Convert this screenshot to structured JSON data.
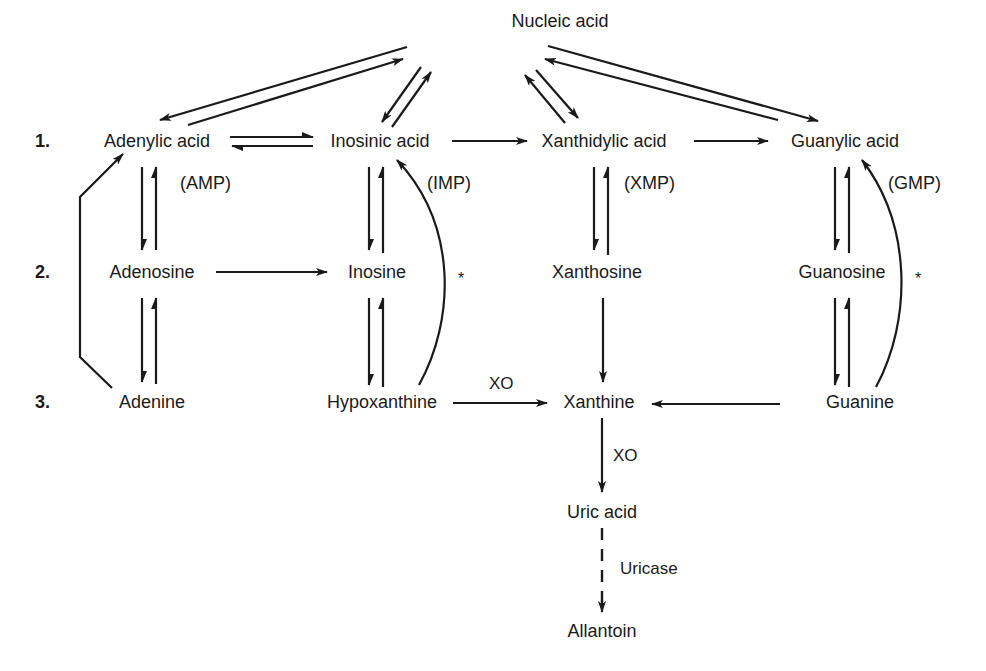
{
  "figure": {
    "type": "purine catabolism pathway diagram",
    "nodes": {
      "nucleic_acid": "Nucleic acid",
      "adenylic_acid": "Adenylic acid",
      "inosinic_acid": "Inosinic acid",
      "xanthidylic_acid": "Xanthidylic acid",
      "guanylic_acid": "Guanylic acid",
      "adenosine": "Adenosine",
      "inosine": "Inosine",
      "xanthosine": "Xanthosine",
      "guanosine": "Guanosine",
      "adenine": "Adenine",
      "hypoxanthine": "Hypoxanthine",
      "xanthine": "Xanthine",
      "guanine": "Guanine",
      "uric_acid": "Uric acid",
      "allantoin": "Allantoin"
    },
    "abbreviations": {
      "amp": "(AMP)",
      "imp": "(IMP)",
      "xmp": "(XMP)",
      "gmp": "(GMP)"
    },
    "row_labels": [
      "1.",
      "2.",
      "3."
    ],
    "enzymes": {
      "xo_hypoxanthine": "XO",
      "xo_xanthine": "XO",
      "uricase": "Uricase"
    },
    "markers": {
      "imp_salvage": "*",
      "gmp_salvage": "*"
    },
    "edges": [
      {
        "from": "Nucleic acid",
        "to": "Adenylic acid",
        "type": "reversible"
      },
      {
        "from": "Nucleic acid",
        "to": "Inosinic acid",
        "type": "reversible"
      },
      {
        "from": "Nucleic acid",
        "to": "Xanthidylic acid",
        "type": "reversible"
      },
      {
        "from": "Nucleic acid",
        "to": "Guanylic acid",
        "type": "reversible"
      },
      {
        "from": "Adenylic acid",
        "to": "Inosinic acid",
        "type": "reversible"
      },
      {
        "from": "Inosinic acid",
        "to": "Xanthidylic acid",
        "type": "forward"
      },
      {
        "from": "Xanthidylic acid",
        "to": "Guanylic acid",
        "type": "forward"
      },
      {
        "from": "Adenylic acid",
        "to": "Adenosine",
        "type": "reversible"
      },
      {
        "from": "Inosinic acid",
        "to": "Inosine",
        "type": "reversible"
      },
      {
        "from": "Xanthidylic acid",
        "to": "Xanthosine",
        "type": "reversible"
      },
      {
        "from": "Guanylic acid",
        "to": "Guanosine",
        "type": "reversible"
      },
      {
        "from": "Adenosine",
        "to": "Inosine",
        "type": "forward"
      },
      {
        "from": "Adenosine",
        "to": "Adenine",
        "type": "reversible"
      },
      {
        "from": "Inosine",
        "to": "Hypoxanthine",
        "type": "reversible"
      },
      {
        "from": "Xanthosine",
        "to": "Xanthine",
        "type": "forward"
      },
      {
        "from": "Guanosine",
        "to": "Guanine",
        "type": "reversible"
      },
      {
        "from": "Adenine",
        "to": "Adenylic acid",
        "type": "forward",
        "note": "bracket salvage"
      },
      {
        "from": "Hypoxanthine",
        "to": "Inosinic acid",
        "type": "forward",
        "note": "curved salvage *"
      },
      {
        "from": "Guanine",
        "to": "Guanylic acid",
        "type": "forward",
        "note": "curved salvage *"
      },
      {
        "from": "Hypoxanthine",
        "to": "Xanthine",
        "type": "forward",
        "enzyme": "XO"
      },
      {
        "from": "Guanine",
        "to": "Xanthine",
        "type": "forward"
      },
      {
        "from": "Xanthine",
        "to": "Uric acid",
        "type": "forward",
        "enzyme": "XO"
      },
      {
        "from": "Uric acid",
        "to": "Allantoin",
        "type": "forward-dashed",
        "enzyme": "Uricase"
      }
    ]
  }
}
